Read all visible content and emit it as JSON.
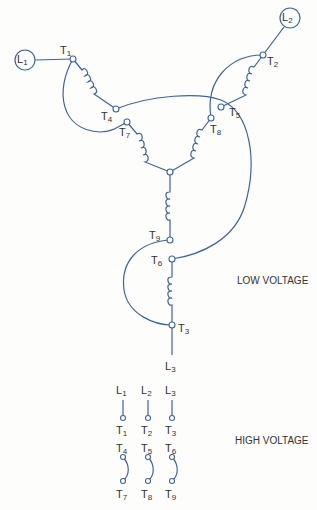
{
  "diagram": {
    "type": "nine-lead wye-connected motor wiring",
    "low_voltage": {
      "title": "LOW VOLTAGE",
      "lines": [
        "L1",
        "L2",
        "L3"
      ],
      "connections": [
        {
          "line": "L1",
          "terminals": [
            "T1",
            "T7"
          ]
        },
        {
          "line": "L2",
          "terminals": [
            "T2",
            "T8"
          ]
        },
        {
          "line": "L3",
          "terminals": [
            "T3",
            "T9"
          ]
        },
        {
          "center": [
            "T4",
            "T5",
            "T6"
          ]
        }
      ]
    },
    "high_voltage": {
      "title": "HIGH VOLTAGE",
      "lines_row": [
        {
          "line": "L",
          "line_sub": "1",
          "terminal": "T",
          "terminal_sub": "1"
        },
        {
          "line": "L",
          "line_sub": "2",
          "terminal": "T",
          "terminal_sub": "2"
        },
        {
          "line": "L",
          "line_sub": "3",
          "terminal": "T",
          "terminal_sub": "3"
        }
      ],
      "jumpers": [
        {
          "top": "T",
          "top_sub": "4",
          "bottom": "T",
          "bottom_sub": "7"
        },
        {
          "top": "T",
          "top_sub": "5",
          "bottom": "T",
          "bottom_sub": "8"
        },
        {
          "top": "T",
          "top_sub": "6",
          "bottom": "T",
          "bottom_sub": "9"
        }
      ]
    },
    "labels": {
      "L": "L",
      "T": "T",
      "s1": "1",
      "s2": "2",
      "s3": "3",
      "s4": "4",
      "s5": "5",
      "s6": "6",
      "s7": "7",
      "s8": "8",
      "s9": "9"
    }
  }
}
